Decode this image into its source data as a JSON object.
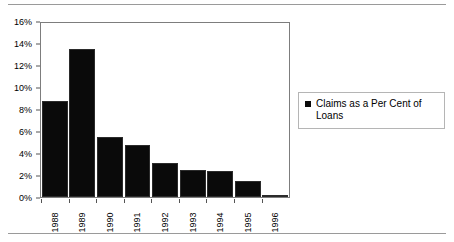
{
  "chart_data": {
    "type": "bar",
    "title": "",
    "subtitle": "",
    "xlabel": "",
    "ylabel": "",
    "categories": [
      "1988",
      "1989",
      "1990",
      "1991",
      "1992",
      "1993",
      "1994",
      "1995",
      "1996"
    ],
    "values": [
      8.8,
      13.6,
      5.5,
      4.8,
      3.15,
      2.5,
      2.4,
      1.5,
      0.2
    ],
    "series": [
      {
        "name": "Claims as a Per Cent of Loans",
        "values": [
          8.8,
          13.6,
          5.5,
          4.8,
          3.15,
          2.5,
          2.4,
          1.5,
          0.2
        ],
        "color": "#0a0a0a"
      }
    ],
    "ylim": [
      0,
      16
    ],
    "ytick_values": [
      0,
      2,
      4,
      6,
      8,
      10,
      12,
      14,
      16
    ],
    "ytick_labels": [
      "0%",
      "2%",
      "4%",
      "6%",
      "8%",
      "10%",
      "12%",
      "14%",
      "16%"
    ],
    "xtick_labels": [
      "1988",
      "1989",
      "1990",
      "1991",
      "1992",
      "1993",
      "1994",
      "1995",
      "1996"
    ],
    "xtick_rotation": 90,
    "grid": false,
    "legend_position": "right",
    "legend_entries": [
      {
        "label": "Claims as a Per Cent of Loans",
        "marker": "square",
        "color": "#0a0a0a"
      }
    ],
    "plot_border_color": "#7d7d7d",
    "background_color": "#ffffff"
  },
  "legend": {
    "label": "Claims as a Per Cent of Loans",
    "marker_name": "legend-square-marker"
  },
  "rules": {
    "top_name": "top-divider-rule",
    "bottom_name": "bottom-divider-rule"
  }
}
